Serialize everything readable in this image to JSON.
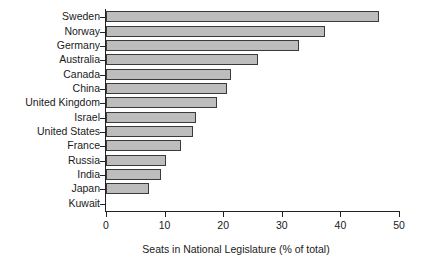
{
  "chart_data": {
    "type": "bar",
    "orientation": "horizontal",
    "title": "",
    "xlabel": "Seats in National Legislature (% of total)",
    "ylabel": "",
    "xlim": [
      0,
      50
    ],
    "xticks": [
      0,
      10,
      20,
      30,
      40,
      50
    ],
    "grid": false,
    "legend": null,
    "bar_color": "#bdbdbd",
    "bar_edge_color": "#3a3a3a",
    "axis_color": "#222222",
    "background": "#ffffff",
    "categories": [
      "Sweden",
      "Norway",
      "Germany",
      "Australia",
      "Canada",
      "China",
      "United Kingdom",
      "Israel",
      "United States",
      "France",
      "Russia",
      "India",
      "Japan",
      "Kuwait"
    ],
    "values": [
      46.6,
      37.3,
      33.0,
      25.9,
      21.3,
      20.6,
      18.9,
      15.4,
      14.8,
      12.8,
      10.3,
      9.4,
      7.3,
      0.0
    ]
  }
}
